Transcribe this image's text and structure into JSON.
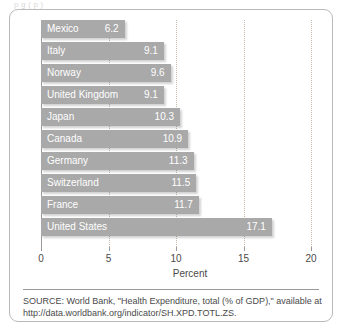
{
  "top_clipped_text": "p   g  (     p    )",
  "chart_data": {
    "type": "bar",
    "orientation": "horizontal",
    "title": "",
    "subtitle": "",
    "xlabel": "Percent",
    "ylabel": "",
    "categories": [
      "Mexico",
      "Italy",
      "Norway",
      "United Kingdom",
      "Japan",
      "Canada",
      "Germany",
      "Switzerland",
      "France",
      "United States"
    ],
    "values": [
      6.2,
      9.1,
      9.6,
      9.1,
      10.3,
      10.9,
      11.3,
      11.5,
      11.7,
      17.1
    ],
    "value_labels": [
      "6.2",
      "9.1",
      "9.6",
      "9.1",
      "10.3",
      "10.9",
      "11.3",
      "11.5",
      "11.7",
      "17.1"
    ],
    "xlim": [
      0,
      20
    ],
    "xticks": [
      0,
      5,
      10,
      15,
      20
    ],
    "xtick_labels": [
      "0",
      "5",
      "10",
      "15",
      "20"
    ],
    "grid": true,
    "grid_axis": "x",
    "grid_style": "dotted",
    "legend": null,
    "bar_color": "#a9a9a9",
    "value_label_color": "#ffffff",
    "category_label_color": "#ffffff",
    "axis_color": "#9a9a9a",
    "gridline_color": "#c6b9a8"
  },
  "source": {
    "line1": "SOURCE: World Bank, \"Health Expenditure, total (% of GDP),\" available at",
    "line2": "http://data.worldbank.org/indicator/SH.XPD.TOTL.ZS."
  }
}
